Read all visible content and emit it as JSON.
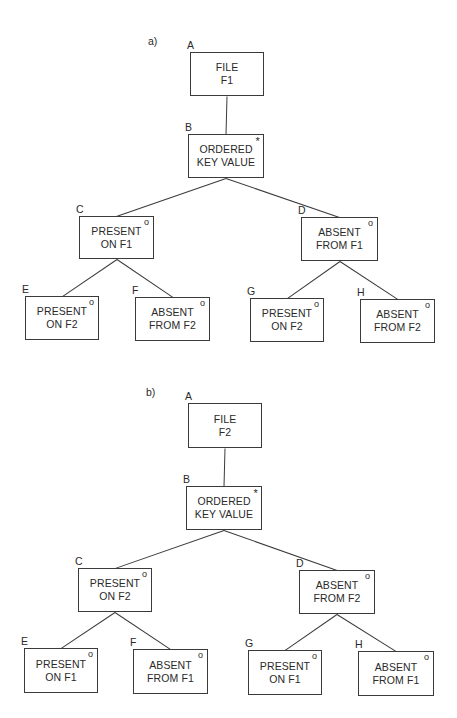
{
  "diagrams": [
    {
      "label": "a)",
      "label_pos": [
        148,
        36
      ],
      "nodes": [
        {
          "id": "A",
          "letter": "A",
          "lines": [
            "FILE",
            "F1"
          ],
          "mark": "",
          "box": [
            190,
            52,
            74,
            44
          ]
        },
        {
          "id": "B",
          "letter": "B",
          "lines": [
            "ORDERED",
            "KEY VALUE"
          ],
          "mark": "*",
          "box": [
            188,
            134,
            76,
            44
          ]
        },
        {
          "id": "C",
          "letter": "C",
          "lines": [
            "PRESENT",
            "ON F1"
          ],
          "mark": "o",
          "box": [
            79,
            216,
            75,
            43
          ]
        },
        {
          "id": "D",
          "letter": "D",
          "lines": [
            "ABSENT",
            "FROM F1"
          ],
          "mark": "o",
          "box": [
            301,
            217,
            77,
            44
          ]
        },
        {
          "id": "E",
          "letter": "E",
          "lines": [
            "PRESENT",
            "ON F2"
          ],
          "mark": "o",
          "box": [
            25,
            296,
            74,
            44
          ]
        },
        {
          "id": "F",
          "letter": "F",
          "lines": [
            "ABSENT",
            "FROM F2"
          ],
          "mark": "o",
          "box": [
            135,
            297,
            75,
            44
          ]
        },
        {
          "id": "G",
          "letter": "G",
          "lines": [
            "PRESENT",
            "ON F2"
          ],
          "mark": "o",
          "box": [
            250,
            298,
            74,
            44
          ]
        },
        {
          "id": "H",
          "letter": "H",
          "lines": [
            "ABSENT",
            "FROM F2"
          ],
          "mark": "o",
          "box": [
            360,
            299,
            75,
            44
          ]
        }
      ],
      "edges": [
        [
          "A",
          "B"
        ],
        [
          "B",
          "C"
        ],
        [
          "B",
          "D"
        ],
        [
          "C",
          "E"
        ],
        [
          "C",
          "F"
        ],
        [
          "D",
          "G"
        ],
        [
          "D",
          "H"
        ]
      ]
    },
    {
      "label": "b)",
      "label_pos": [
        146,
        387
      ],
      "nodes": [
        {
          "id": "A",
          "letter": "A",
          "lines": [
            "FILE",
            "F2"
          ],
          "mark": "",
          "box": [
            188,
            403,
            74,
            45
          ]
        },
        {
          "id": "B",
          "letter": "B",
          "lines": [
            "ORDERED",
            "KEY VALUE"
          ],
          "mark": "*",
          "box": [
            186,
            486,
            76,
            44
          ]
        },
        {
          "id": "C",
          "letter": "C",
          "lines": [
            "PRESENT",
            "ON F2"
          ],
          "mark": "o",
          "box": [
            78,
            568,
            74,
            44
          ]
        },
        {
          "id": "D",
          "letter": "D",
          "lines": [
            "ABSENT",
            "FROM F2"
          ],
          "mark": "o",
          "box": [
            299,
            570,
            76,
            44
          ]
        },
        {
          "id": "E",
          "letter": "E",
          "lines": [
            "PRESENT",
            "ON F1"
          ],
          "mark": "o",
          "box": [
            24,
            648,
            74,
            45
          ]
        },
        {
          "id": "F",
          "letter": "F",
          "lines": [
            "ABSENT",
            "FROM F1"
          ],
          "mark": "o",
          "box": [
            133,
            649,
            75,
            45
          ]
        },
        {
          "id": "G",
          "letter": "G",
          "lines": [
            "PRESENT",
            "ON F1"
          ],
          "mark": "o",
          "box": [
            248,
            650,
            74,
            45
          ]
        },
        {
          "id": "H",
          "letter": "H",
          "lines": [
            "ABSENT",
            "FROM F1"
          ],
          "mark": "o",
          "box": [
            358,
            651,
            76,
            45
          ]
        }
      ],
      "edges": [
        [
          "A",
          "B"
        ],
        [
          "B",
          "C"
        ],
        [
          "B",
          "D"
        ],
        [
          "C",
          "E"
        ],
        [
          "C",
          "F"
        ],
        [
          "D",
          "G"
        ],
        [
          "D",
          "H"
        ]
      ]
    }
  ],
  "colors": {
    "stroke": "#3a3a3a",
    "text": "#2a2a2a",
    "background": "#ffffff"
  }
}
